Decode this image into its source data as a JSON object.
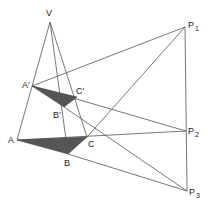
{
  "diagram": {
    "points": {
      "V": {
        "x": 50,
        "y": 22,
        "label": "V"
      },
      "P1": {
        "x": 185,
        "y": 27,
        "label": "P",
        "sub": "1"
      },
      "P2": {
        "x": 186,
        "y": 131,
        "label": "P",
        "sub": "2"
      },
      "P3": {
        "x": 187,
        "y": 191,
        "label": "P",
        "sub": "3"
      },
      "A": {
        "x": 17,
        "y": 140,
        "label": "A"
      },
      "B": {
        "x": 68,
        "y": 154,
        "label": "B"
      },
      "C": {
        "x": 87,
        "y": 137,
        "label": "C"
      },
      "A'": {
        "x": 32,
        "y": 86,
        "label": "A′"
      },
      "B'": {
        "x": 64,
        "y": 107,
        "label": "B′"
      },
      "C'": {
        "x": 77,
        "y": 97,
        "label": "C′"
      }
    },
    "triangles": [
      {
        "name": "ABC",
        "fill": "#555555"
      },
      {
        "name": "A'B'C'",
        "fill": "#555555"
      }
    ],
    "line_color": "#555555"
  }
}
